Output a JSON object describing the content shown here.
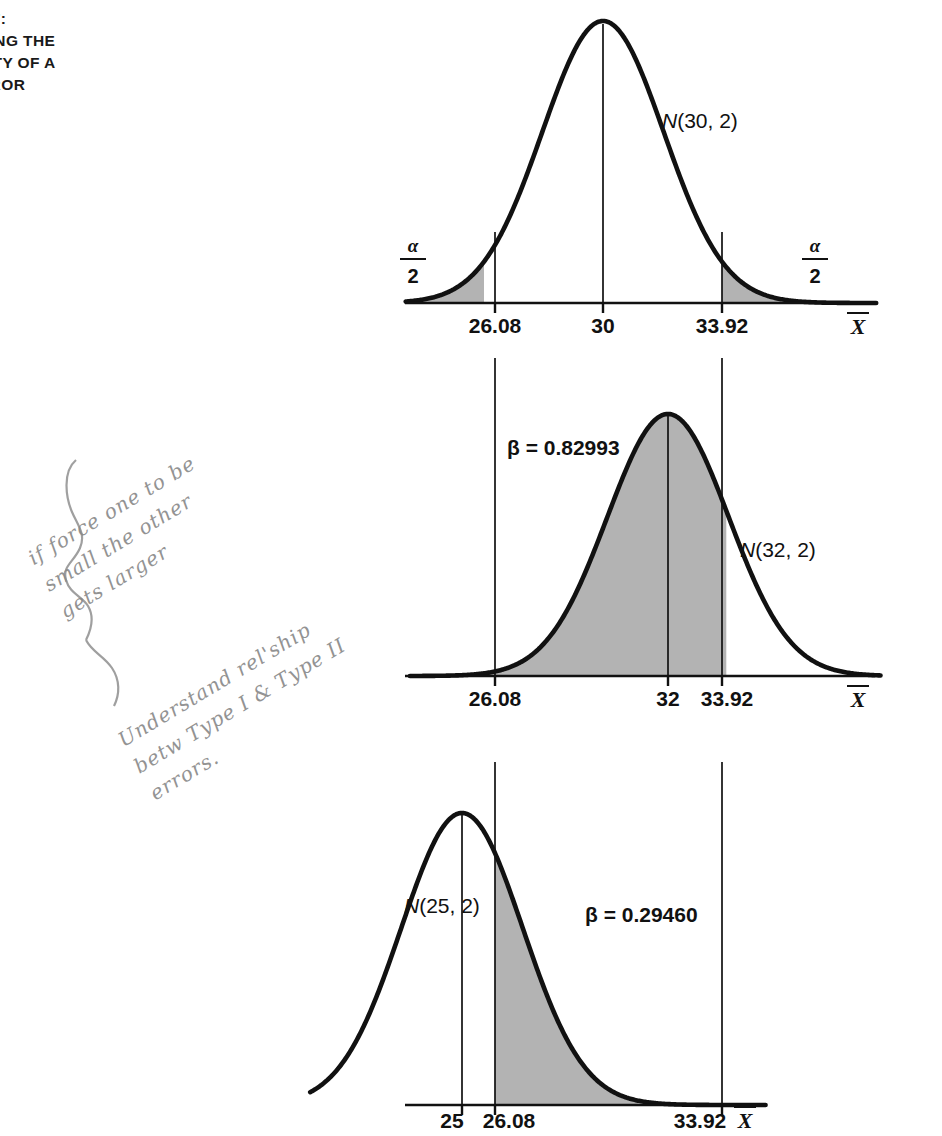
{
  "figure": {
    "caption_lines": [
      "3.7:",
      "NING THE",
      "LITY OF A",
      "RROR"
    ],
    "x_axis_label": "X",
    "alpha_numerator": "α",
    "alpha_denominator": "2"
  },
  "panels": {
    "top": {
      "curve_label": "N(30, 2)",
      "tick_labels": [
        "26.08",
        "30",
        "33.92"
      ],
      "left_alpha_label": "α/2",
      "right_alpha_label": "α/2",
      "axis_label": "X"
    },
    "middle": {
      "curve_label": "N(32, 2)",
      "beta_label": "β = 0.82993",
      "tick_labels": [
        "26.08",
        "32",
        "33.92"
      ],
      "axis_label": "X"
    },
    "bottom": {
      "curve_label": "N(25, 2)",
      "beta_label": "β = 0.29460",
      "tick_labels": [
        "25",
        "26.08",
        "33.92"
      ],
      "axis_label": "X"
    }
  },
  "annotations": {
    "note_1_lines": [
      "if force one to be",
      "small the other",
      "gets larger"
    ],
    "note_2_lines": [
      "Understand rel'ship",
      "betw Type I & Type II",
      "errors."
    ]
  },
  "chart_data": {
    "type": "line",
    "xlabel": "X̄",
    "ylabel": "",
    "grid": false,
    "legend": "none",
    "critical_values": [
      26.08,
      33.92
    ],
    "alpha_tail_label": "α/2",
    "panels": [
      {
        "name": "top",
        "distribution": "N(30, 2)",
        "mean": 30,
        "sd": 2,
        "xlim": [
          23.5,
          39.0
        ],
        "tick_values": [
          26.08,
          30,
          33.92
        ],
        "tick_labels": [
          "26.08",
          "30",
          "33.92"
        ],
        "shaded_regions": [
          {
            "from": 23.5,
            "to": 26.08,
            "label": "α/2"
          },
          {
            "from": 33.92,
            "to": 39.0,
            "label": "α/2"
          }
        ],
        "beta": null
      },
      {
        "name": "middle",
        "distribution": "N(32, 2)",
        "mean": 32,
        "sd": 2,
        "xlim": [
          23.5,
          39.0
        ],
        "tick_values": [
          26.08,
          32,
          33.92
        ],
        "tick_labels": [
          "26.08",
          "32",
          "33.92"
        ],
        "shaded_regions": [
          {
            "from": 26.08,
            "to": 33.92,
            "label": "β = 0.82993"
          }
        ],
        "beta": 0.82993
      },
      {
        "name": "bottom",
        "distribution": "N(25, 2)",
        "mean": 25,
        "sd": 2,
        "xlim": [
          20.0,
          35.0
        ],
        "tick_values": [
          25,
          26.08,
          33.92
        ],
        "tick_labels": [
          "25",
          "26.08",
          "33.92"
        ],
        "shaded_regions": [
          {
            "from": 26.08,
            "to": 33.92,
            "label": "β = 0.29460"
          }
        ],
        "beta": 0.2946
      }
    ]
  }
}
